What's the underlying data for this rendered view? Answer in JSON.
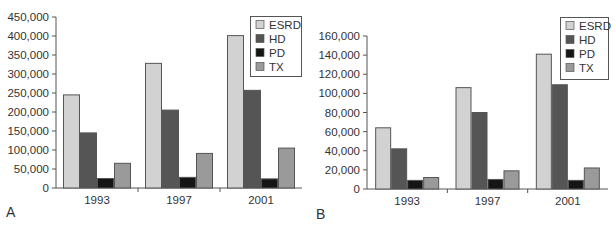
{
  "colors": {
    "ESRD": "#d2d2d2",
    "HD": "#555555",
    "PD": "#151515",
    "TX": "#9a9a9a",
    "border": "#555555",
    "axis": "#555555",
    "text": "#333333"
  },
  "chart_data": [
    {
      "panel_label": "A",
      "type": "bar",
      "title": "",
      "xlabel": "",
      "ylabel": "",
      "categories": [
        "1993",
        "1997",
        "2001"
      ],
      "series": [
        {
          "name": "ESRD",
          "values": [
            245000,
            328000,
            401000
          ]
        },
        {
          "name": "HD",
          "values": [
            145000,
            205000,
            257000
          ]
        },
        {
          "name": "PD",
          "values": [
            25000,
            28000,
            24000
          ]
        },
        {
          "name": "TX",
          "values": [
            65000,
            91000,
            105000
          ]
        }
      ],
      "ylim": [
        0,
        450000
      ],
      "yticks": [
        "0",
        "50,000",
        "100,000",
        "150,000",
        "200,000",
        "250,000",
        "300,000",
        "350,000",
        "400,000",
        "450,000"
      ],
      "grid": false,
      "legend_position": "top-right"
    },
    {
      "panel_label": "B",
      "type": "bar",
      "title": "",
      "xlabel": "",
      "ylabel": "",
      "categories": [
        "1993",
        "1997",
        "2001"
      ],
      "series": [
        {
          "name": "ESRD",
          "values": [
            64000,
            106000,
            141000
          ]
        },
        {
          "name": "HD",
          "values": [
            42000,
            80000,
            109000
          ]
        },
        {
          "name": "PD",
          "values": [
            9000,
            10000,
            9000
          ]
        },
        {
          "name": "TX",
          "values": [
            12000,
            19000,
            22000
          ]
        }
      ],
      "ylim": [
        0,
        160000
      ],
      "yticks": [
        "0",
        "20,000",
        "40,000",
        "60,000",
        "80,000",
        "100,000",
        "120,000",
        "140,000",
        "160,000"
      ],
      "grid": false,
      "legend_position": "top-right"
    }
  ]
}
